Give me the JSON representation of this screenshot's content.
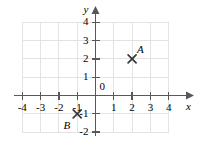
{
  "chart_data": {
    "type": "scatter",
    "title": "",
    "xlabel": "x",
    "ylabel": "y",
    "xlim": [
      -4,
      4
    ],
    "ylim": [
      -2,
      4
    ],
    "grid": true,
    "legend": "none",
    "x_ticks": [
      "-4",
      "-3",
      "-2",
      "-1",
      "1",
      "2",
      "3",
      "4"
    ],
    "x_tick_values": [
      -4,
      -3,
      -2,
      -1,
      1,
      2,
      3,
      4
    ],
    "y_ticks": [
      "4",
      "3",
      "2",
      "1",
      "-1",
      "-2"
    ],
    "y_tick_values": [
      4,
      3,
      2,
      1,
      -1,
      -2
    ],
    "origin_label": "0",
    "points": [
      {
        "label": "A",
        "x": 2,
        "y": 2,
        "marker": "x",
        "label_position": "upper-right"
      },
      {
        "label": "B",
        "x": -1,
        "y": -1,
        "marker": "x",
        "label_position": "lower-left"
      }
    ]
  },
  "axes": {
    "x_axis_name": "x",
    "y_axis_name": "y",
    "origin": "0"
  },
  "colors": {
    "background": "#ffffff",
    "gridline": "#e3e3e3",
    "axis": "#58585a",
    "text": "#4a4a4c",
    "marker": "#3a3a3c"
  }
}
